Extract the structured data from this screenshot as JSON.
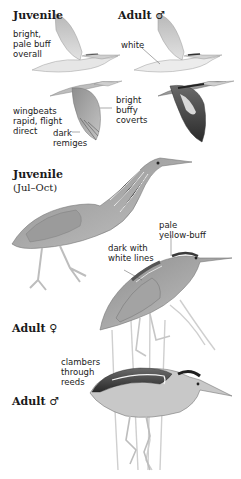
{
  "plate": {
    "flight_section": {
      "juvenile": {
        "heading": "Juvenile",
        "note_lines": [
          "bright,",
          "pale buff",
          "overall"
        ]
      },
      "adult_male": {
        "heading": "Adult ♂",
        "note": "white"
      },
      "wingbeats_note_lines": [
        "wingbeats",
        "rapid, flight",
        "direct"
      ],
      "coverts_note_lines": [
        "bright",
        "buffy",
        "coverts"
      ],
      "remiges_note_lines": [
        "dark",
        "remiges"
      ]
    },
    "juvenile_standing": {
      "heading": "Juvenile",
      "season": "(Jul–Oct)"
    },
    "adult_female": {
      "heading": "Adult ♀",
      "crown_note_lines": [
        "pale",
        "yellow-buff"
      ],
      "back_note_lines": [
        "dark with",
        "white lines"
      ]
    },
    "adult_male_perched": {
      "heading": "Adult ♂",
      "behavior_note_lines": [
        "clambers",
        "through",
        "reeds"
      ]
    }
  },
  "colors": {
    "ink": "#1a1a1a",
    "background": "#ffffff",
    "plumage_light": "#d9d9d9",
    "plumage_mid": "#a8a8a8",
    "plumage_dark": "#3a3a3a"
  }
}
